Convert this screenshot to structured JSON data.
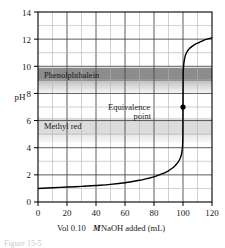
{
  "figure": {
    "caption_fragment": "Figure 15-5"
  },
  "chart_data": {
    "type": "line",
    "title": "",
    "xlabel_parts": {
      "pre": "Vol 0.10",
      "italic": "M",
      "post": "NaOH added (mL)"
    },
    "xlabel": "Vol 0.10 M NaOH added (mL)",
    "ylabel": "pH",
    "xlim": [
      0,
      120
    ],
    "ylim": [
      0,
      14
    ],
    "x_major_ticks": [
      0,
      20,
      40,
      60,
      80,
      100,
      120
    ],
    "x_minor_step": 10,
    "y_major_ticks": [
      0,
      2,
      4,
      6,
      8,
      10,
      12,
      14
    ],
    "y_minor_step": 1,
    "x_tick_labels": [
      "0",
      "20",
      "40",
      "60",
      "80",
      "100",
      "120"
    ],
    "y_tick_labels": [
      "0",
      "2",
      "4",
      "6",
      "8",
      "10",
      "12",
      "14"
    ],
    "grid": true,
    "legend": "none",
    "series": [
      {
        "name": "Titration curve",
        "x": [
          0,
          10,
          20,
          30,
          40,
          50,
          60,
          70,
          75,
          80,
          85,
          90,
          92,
          94,
          96,
          97,
          98,
          98.5,
          99,
          99.3,
          99.6,
          99.8,
          99.9,
          100,
          100.1,
          100.2,
          100.4,
          100.7,
          101,
          101.5,
          102,
          103,
          104,
          106,
          108,
          110,
          113,
          116,
          120
        ],
        "y": [
          1.0,
          1.05,
          1.1,
          1.15,
          1.22,
          1.3,
          1.42,
          1.6,
          1.72,
          1.85,
          2.05,
          2.3,
          2.45,
          2.62,
          2.85,
          3.0,
          3.2,
          3.35,
          3.55,
          3.75,
          4.0,
          4.4,
          4.8,
          7.0,
          9.2,
          9.6,
          10.0,
          10.3,
          10.5,
          10.75,
          10.9,
          11.1,
          11.25,
          11.45,
          11.6,
          11.7,
          11.85,
          11.98,
          12.1
        ]
      }
    ],
    "annotations": [
      {
        "name": "equivalence-point",
        "label_line1": "Equivalence",
        "label_line2": "point",
        "x": 100,
        "y": 7,
        "marker": "filled-circle"
      }
    ],
    "indicator_bands": [
      {
        "name": "phenolphthalein",
        "label": "Phenolphthalein",
        "ph_low": 8.2,
        "ph_high": 10.0,
        "core_low": 9.0,
        "core_high": 10.0,
        "color_core": "#8c8c8c",
        "color_fade": "#c9c9c9"
      },
      {
        "name": "methyl-red",
        "label": "Methyl red",
        "ph_low": 4.4,
        "ph_high": 6.2,
        "core_low": 4.9,
        "core_high": 6.2,
        "color_core": "#d8d8d8",
        "color_fade": "#ececec"
      }
    ],
    "colors": {
      "curve": "#000000",
      "axis": "#000000",
      "grid_major": "#5a5a5a",
      "grid_minor": "#b0b0b0",
      "background": "#ffffff"
    }
  }
}
